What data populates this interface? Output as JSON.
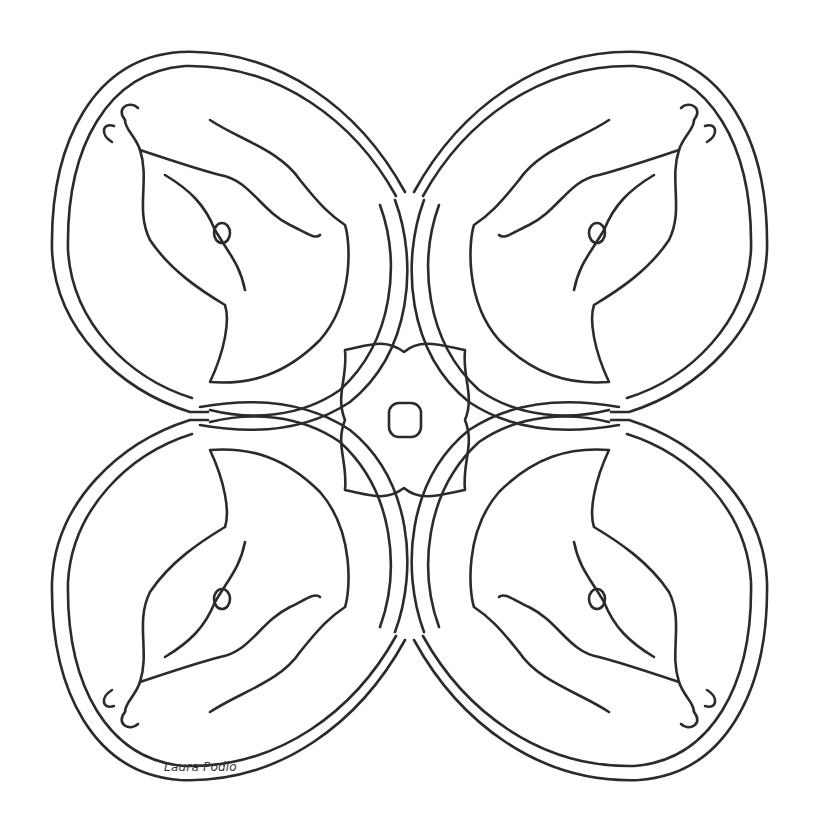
{
  "artwork": {
    "type": "mandala coloring page",
    "background": "#ffffff",
    "line_color": "#2b2b2b",
    "symmetry": "4-fold mirror",
    "signature": "Laura Podio"
  }
}
